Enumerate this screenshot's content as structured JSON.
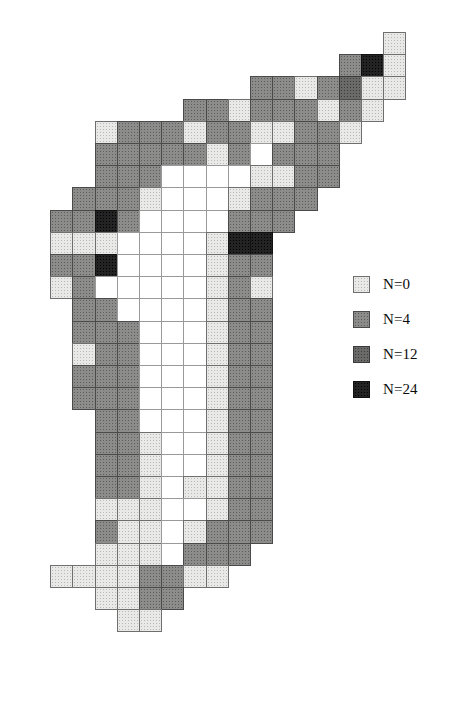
{
  "figure": {
    "type": "grid-choropleth-map",
    "background_color": "#ffffff",
    "width": 452,
    "height": 701
  },
  "grid": {
    "cell_width": 22.2,
    "cell_height": 22.2,
    "origin_x": 28,
    "origin_y": 32,
    "columns": 17,
    "rows": 30,
    "class_keys": [
      "white",
      "0",
      "4",
      "12",
      "24"
    ],
    "class_colors": {
      "white": "#ffffff",
      "0": "#e9e9e7",
      "4": "#8c8c8a",
      "12": "#6a6a68",
      "24": "#232323"
    },
    "cells": [
      {
        "c": 16,
        "r": 0,
        "v": "0"
      },
      {
        "c": 14,
        "r": 1,
        "v": "4"
      },
      {
        "c": 15,
        "r": 1,
        "v": "24"
      },
      {
        "c": 16,
        "r": 1,
        "v": "0"
      },
      {
        "c": 10,
        "r": 2,
        "v": "4"
      },
      {
        "c": 11,
        "r": 2,
        "v": "4"
      },
      {
        "c": 12,
        "r": 2,
        "v": "0"
      },
      {
        "c": 13,
        "r": 2,
        "v": "4"
      },
      {
        "c": 14,
        "r": 2,
        "v": "12"
      },
      {
        "c": 15,
        "r": 2,
        "v": "0"
      },
      {
        "c": 16,
        "r": 2,
        "v": "0"
      },
      {
        "c": 7,
        "r": 3,
        "v": "4"
      },
      {
        "c": 8,
        "r": 3,
        "v": "4"
      },
      {
        "c": 9,
        "r": 3,
        "v": "0"
      },
      {
        "c": 10,
        "r": 3,
        "v": "4"
      },
      {
        "c": 11,
        "r": 3,
        "v": "4"
      },
      {
        "c": 12,
        "r": 3,
        "v": "4"
      },
      {
        "c": 13,
        "r": 3,
        "v": "0"
      },
      {
        "c": 14,
        "r": 3,
        "v": "4"
      },
      {
        "c": 15,
        "r": 3,
        "v": "0"
      },
      {
        "c": 3,
        "r": 4,
        "v": "0"
      },
      {
        "c": 4,
        "r": 4,
        "v": "4"
      },
      {
        "c": 5,
        "r": 4,
        "v": "4"
      },
      {
        "c": 6,
        "r": 4,
        "v": "4"
      },
      {
        "c": 7,
        "r": 4,
        "v": "0"
      },
      {
        "c": 8,
        "r": 4,
        "v": "4"
      },
      {
        "c": 9,
        "r": 4,
        "v": "4"
      },
      {
        "c": 10,
        "r": 4,
        "v": "0"
      },
      {
        "c": 11,
        "r": 4,
        "v": "0"
      },
      {
        "c": 12,
        "r": 4,
        "v": "4"
      },
      {
        "c": 13,
        "r": 4,
        "v": "4"
      },
      {
        "c": 14,
        "r": 4,
        "v": "0"
      },
      {
        "c": 3,
        "r": 5,
        "v": "4"
      },
      {
        "c": 4,
        "r": 5,
        "v": "4"
      },
      {
        "c": 5,
        "r": 5,
        "v": "4"
      },
      {
        "c": 6,
        "r": 5,
        "v": "4"
      },
      {
        "c": 7,
        "r": 5,
        "v": "4"
      },
      {
        "c": 8,
        "r": 5,
        "v": "0"
      },
      {
        "c": 9,
        "r": 5,
        "v": "4"
      },
      {
        "c": 10,
        "r": 5,
        "v": "white"
      },
      {
        "c": 11,
        "r": 5,
        "v": "4"
      },
      {
        "c": 12,
        "r": 5,
        "v": "4"
      },
      {
        "c": 13,
        "r": 5,
        "v": "4"
      },
      {
        "c": 3,
        "r": 6,
        "v": "4"
      },
      {
        "c": 4,
        "r": 6,
        "v": "4"
      },
      {
        "c": 5,
        "r": 6,
        "v": "4"
      },
      {
        "c": 6,
        "r": 6,
        "v": "white"
      },
      {
        "c": 7,
        "r": 6,
        "v": "white"
      },
      {
        "c": 8,
        "r": 6,
        "v": "white"
      },
      {
        "c": 9,
        "r": 6,
        "v": "white"
      },
      {
        "c": 10,
        "r": 6,
        "v": "0"
      },
      {
        "c": 11,
        "r": 6,
        "v": "0"
      },
      {
        "c": 12,
        "r": 6,
        "v": "4"
      },
      {
        "c": 13,
        "r": 6,
        "v": "4"
      },
      {
        "c": 2,
        "r": 7,
        "v": "4"
      },
      {
        "c": 3,
        "r": 7,
        "v": "4"
      },
      {
        "c": 4,
        "r": 7,
        "v": "4"
      },
      {
        "c": 5,
        "r": 7,
        "v": "0"
      },
      {
        "c": 6,
        "r": 7,
        "v": "white"
      },
      {
        "c": 7,
        "r": 7,
        "v": "white"
      },
      {
        "c": 8,
        "r": 7,
        "v": "white"
      },
      {
        "c": 9,
        "r": 7,
        "v": "0"
      },
      {
        "c": 10,
        "r": 7,
        "v": "4"
      },
      {
        "c": 11,
        "r": 7,
        "v": "4"
      },
      {
        "c": 12,
        "r": 7,
        "v": "4"
      },
      {
        "c": 1,
        "r": 8,
        "v": "4"
      },
      {
        "c": 2,
        "r": 8,
        "v": "4"
      },
      {
        "c": 3,
        "r": 8,
        "v": "24"
      },
      {
        "c": 4,
        "r": 8,
        "v": "4"
      },
      {
        "c": 5,
        "r": 8,
        "v": "white"
      },
      {
        "c": 6,
        "r": 8,
        "v": "white"
      },
      {
        "c": 7,
        "r": 8,
        "v": "white"
      },
      {
        "c": 8,
        "r": 8,
        "v": "white"
      },
      {
        "c": 9,
        "r": 8,
        "v": "4"
      },
      {
        "c": 10,
        "r": 8,
        "v": "4"
      },
      {
        "c": 11,
        "r": 8,
        "v": "4"
      },
      {
        "c": 1,
        "r": 9,
        "v": "0"
      },
      {
        "c": 2,
        "r": 9,
        "v": "0"
      },
      {
        "c": 3,
        "r": 9,
        "v": "0"
      },
      {
        "c": 4,
        "r": 9,
        "v": "white"
      },
      {
        "c": 5,
        "r": 9,
        "v": "white"
      },
      {
        "c": 6,
        "r": 9,
        "v": "white"
      },
      {
        "c": 7,
        "r": 9,
        "v": "white"
      },
      {
        "c": 8,
        "r": 9,
        "v": "0"
      },
      {
        "c": 9,
        "r": 9,
        "v": "24"
      },
      {
        "c": 10,
        "r": 9,
        "v": "24"
      },
      {
        "c": 1,
        "r": 10,
        "v": "4"
      },
      {
        "c": 2,
        "r": 10,
        "v": "4"
      },
      {
        "c": 3,
        "r": 10,
        "v": "24"
      },
      {
        "c": 4,
        "r": 10,
        "v": "white"
      },
      {
        "c": 5,
        "r": 10,
        "v": "white"
      },
      {
        "c": 6,
        "r": 10,
        "v": "white"
      },
      {
        "c": 7,
        "r": 10,
        "v": "white"
      },
      {
        "c": 8,
        "r": 10,
        "v": "0"
      },
      {
        "c": 9,
        "r": 10,
        "v": "4"
      },
      {
        "c": 10,
        "r": 10,
        "v": "4"
      },
      {
        "c": 1,
        "r": 11,
        "v": "0"
      },
      {
        "c": 2,
        "r": 11,
        "v": "4"
      },
      {
        "c": 3,
        "r": 11,
        "v": "white"
      },
      {
        "c": 4,
        "r": 11,
        "v": "white"
      },
      {
        "c": 5,
        "r": 11,
        "v": "white"
      },
      {
        "c": 6,
        "r": 11,
        "v": "white"
      },
      {
        "c": 7,
        "r": 11,
        "v": "white"
      },
      {
        "c": 8,
        "r": 11,
        "v": "0"
      },
      {
        "c": 9,
        "r": 11,
        "v": "4"
      },
      {
        "c": 10,
        "r": 11,
        "v": "0"
      },
      {
        "c": 2,
        "r": 12,
        "v": "4"
      },
      {
        "c": 3,
        "r": 12,
        "v": "4"
      },
      {
        "c": 4,
        "r": 12,
        "v": "white"
      },
      {
        "c": 5,
        "r": 12,
        "v": "white"
      },
      {
        "c": 6,
        "r": 12,
        "v": "white"
      },
      {
        "c": 7,
        "r": 12,
        "v": "white"
      },
      {
        "c": 8,
        "r": 12,
        "v": "0"
      },
      {
        "c": 9,
        "r": 12,
        "v": "4"
      },
      {
        "c": 10,
        "r": 12,
        "v": "4"
      },
      {
        "c": 2,
        "r": 13,
        "v": "4"
      },
      {
        "c": 3,
        "r": 13,
        "v": "4"
      },
      {
        "c": 4,
        "r": 13,
        "v": "4"
      },
      {
        "c": 5,
        "r": 13,
        "v": "white"
      },
      {
        "c": 6,
        "r": 13,
        "v": "white"
      },
      {
        "c": 7,
        "r": 13,
        "v": "white"
      },
      {
        "c": 8,
        "r": 13,
        "v": "0"
      },
      {
        "c": 9,
        "r": 13,
        "v": "4"
      },
      {
        "c": 10,
        "r": 13,
        "v": "4"
      },
      {
        "c": 2,
        "r": 14,
        "v": "0"
      },
      {
        "c": 3,
        "r": 14,
        "v": "4"
      },
      {
        "c": 4,
        "r": 14,
        "v": "4"
      },
      {
        "c": 5,
        "r": 14,
        "v": "white"
      },
      {
        "c": 6,
        "r": 14,
        "v": "white"
      },
      {
        "c": 7,
        "r": 14,
        "v": "white"
      },
      {
        "c": 8,
        "r": 14,
        "v": "0"
      },
      {
        "c": 9,
        "r": 14,
        "v": "4"
      },
      {
        "c": 10,
        "r": 14,
        "v": "4"
      },
      {
        "c": 2,
        "r": 15,
        "v": "4"
      },
      {
        "c": 3,
        "r": 15,
        "v": "4"
      },
      {
        "c": 4,
        "r": 15,
        "v": "4"
      },
      {
        "c": 5,
        "r": 15,
        "v": "white"
      },
      {
        "c": 6,
        "r": 15,
        "v": "white"
      },
      {
        "c": 7,
        "r": 15,
        "v": "white"
      },
      {
        "c": 8,
        "r": 15,
        "v": "0"
      },
      {
        "c": 9,
        "r": 15,
        "v": "4"
      },
      {
        "c": 10,
        "r": 15,
        "v": "4"
      },
      {
        "c": 2,
        "r": 16,
        "v": "4"
      },
      {
        "c": 3,
        "r": 16,
        "v": "4"
      },
      {
        "c": 4,
        "r": 16,
        "v": "4"
      },
      {
        "c": 5,
        "r": 16,
        "v": "white"
      },
      {
        "c": 6,
        "r": 16,
        "v": "white"
      },
      {
        "c": 7,
        "r": 16,
        "v": "white"
      },
      {
        "c": 8,
        "r": 16,
        "v": "0"
      },
      {
        "c": 9,
        "r": 16,
        "v": "4"
      },
      {
        "c": 10,
        "r": 16,
        "v": "4"
      },
      {
        "c": 3,
        "r": 17,
        "v": "4"
      },
      {
        "c": 4,
        "r": 17,
        "v": "4"
      },
      {
        "c": 5,
        "r": 17,
        "v": "white"
      },
      {
        "c": 6,
        "r": 17,
        "v": "white"
      },
      {
        "c": 7,
        "r": 17,
        "v": "white"
      },
      {
        "c": 8,
        "r": 17,
        "v": "0"
      },
      {
        "c": 9,
        "r": 17,
        "v": "4"
      },
      {
        "c": 10,
        "r": 17,
        "v": "4"
      },
      {
        "c": 3,
        "r": 18,
        "v": "4"
      },
      {
        "c": 4,
        "r": 18,
        "v": "4"
      },
      {
        "c": 5,
        "r": 18,
        "v": "0"
      },
      {
        "c": 6,
        "r": 18,
        "v": "white"
      },
      {
        "c": 7,
        "r": 18,
        "v": "white"
      },
      {
        "c": 8,
        "r": 18,
        "v": "0"
      },
      {
        "c": 9,
        "r": 18,
        "v": "4"
      },
      {
        "c": 10,
        "r": 18,
        "v": "4"
      },
      {
        "c": 3,
        "r": 19,
        "v": "4"
      },
      {
        "c": 4,
        "r": 19,
        "v": "4"
      },
      {
        "c": 5,
        "r": 19,
        "v": "0"
      },
      {
        "c": 6,
        "r": 19,
        "v": "white"
      },
      {
        "c": 7,
        "r": 19,
        "v": "white"
      },
      {
        "c": 8,
        "r": 19,
        "v": "0"
      },
      {
        "c": 9,
        "r": 19,
        "v": "4"
      },
      {
        "c": 10,
        "r": 19,
        "v": "4"
      },
      {
        "c": 3,
        "r": 20,
        "v": "4"
      },
      {
        "c": 4,
        "r": 20,
        "v": "4"
      },
      {
        "c": 5,
        "r": 20,
        "v": "0"
      },
      {
        "c": 6,
        "r": 20,
        "v": "white"
      },
      {
        "c": 7,
        "r": 20,
        "v": "0"
      },
      {
        "c": 8,
        "r": 20,
        "v": "0"
      },
      {
        "c": 9,
        "r": 20,
        "v": "4"
      },
      {
        "c": 10,
        "r": 20,
        "v": "4"
      },
      {
        "c": 3,
        "r": 21,
        "v": "0"
      },
      {
        "c": 4,
        "r": 21,
        "v": "0"
      },
      {
        "c": 5,
        "r": 21,
        "v": "0"
      },
      {
        "c": 6,
        "r": 21,
        "v": "white"
      },
      {
        "c": 7,
        "r": 21,
        "v": "white"
      },
      {
        "c": 8,
        "r": 21,
        "v": "0"
      },
      {
        "c": 9,
        "r": 21,
        "v": "4"
      },
      {
        "c": 10,
        "r": 21,
        "v": "4"
      },
      {
        "c": 3,
        "r": 22,
        "v": "4"
      },
      {
        "c": 4,
        "r": 22,
        "v": "0"
      },
      {
        "c": 5,
        "r": 22,
        "v": "0"
      },
      {
        "c": 6,
        "r": 22,
        "v": "white"
      },
      {
        "c": 7,
        "r": 22,
        "v": "0"
      },
      {
        "c": 8,
        "r": 22,
        "v": "4"
      },
      {
        "c": 9,
        "r": 22,
        "v": "4"
      },
      {
        "c": 10,
        "r": 22,
        "v": "4"
      },
      {
        "c": 3,
        "r": 23,
        "v": "0"
      },
      {
        "c": 4,
        "r": 23,
        "v": "0"
      },
      {
        "c": 5,
        "r": 23,
        "v": "0"
      },
      {
        "c": 6,
        "r": 23,
        "v": "white"
      },
      {
        "c": 7,
        "r": 23,
        "v": "4"
      },
      {
        "c": 8,
        "r": 23,
        "v": "4"
      },
      {
        "c": 9,
        "r": 23,
        "v": "4"
      },
      {
        "c": 1,
        "r": 24,
        "v": "0"
      },
      {
        "c": 2,
        "r": 24,
        "v": "0"
      },
      {
        "c": 3,
        "r": 24,
        "v": "0"
      },
      {
        "c": 4,
        "r": 24,
        "v": "0"
      },
      {
        "c": 5,
        "r": 24,
        "v": "4"
      },
      {
        "c": 6,
        "r": 24,
        "v": "4"
      },
      {
        "c": 7,
        "r": 24,
        "v": "0"
      },
      {
        "c": 8,
        "r": 24,
        "v": "0"
      },
      {
        "c": 3,
        "r": 25,
        "v": "0"
      },
      {
        "c": 4,
        "r": 25,
        "v": "0"
      },
      {
        "c": 5,
        "r": 25,
        "v": "4"
      },
      {
        "c": 6,
        "r": 25,
        "v": "4"
      },
      {
        "c": 4,
        "r": 26,
        "v": "0"
      },
      {
        "c": 5,
        "r": 26,
        "v": "0"
      }
    ]
  },
  "legend": {
    "position": {
      "x": 353,
      "y": 276
    },
    "row_spacing": 35,
    "items": [
      {
        "swatch_class": "0",
        "label": "N=0",
        "color": "#e9e9e7"
      },
      {
        "swatch_class": "4",
        "label": "N=4",
        "color": "#8c8c8a"
      },
      {
        "swatch_class": "12",
        "label": "N=12",
        "color": "#6a6a68"
      },
      {
        "swatch_class": "24",
        "label": "N=24",
        "color": "#232323"
      }
    ]
  }
}
